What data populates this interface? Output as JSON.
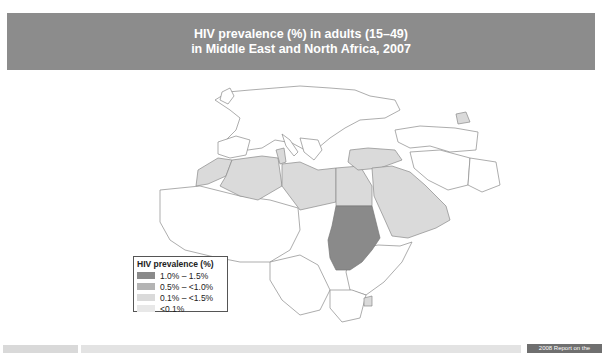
{
  "header": {
    "title_line1": "HIV prevalence (%) in adults (15–49)",
    "title_line2": "in Middle East and North Africa, 2007"
  },
  "legend": {
    "title": "HIV prevalence (%)",
    "items": [
      {
        "label": "1.0% – 1.5%",
        "color": "#8a8a8a"
      },
      {
        "label": "0.5% – <1.0%",
        "color": "#b4b4b4"
      },
      {
        "label": "0.1% – <1.5%",
        "color": "#dadada"
      },
      {
        "label": "<0.1%",
        "color": "#e8e8e8"
      }
    ]
  },
  "map": {
    "region": "Middle East and North Africa",
    "highlighted": [
      {
        "country": "Sudan",
        "category": "1.0% – 1.5%"
      },
      {
        "country": "Morocco",
        "category": "0.1% – <1.5%"
      },
      {
        "country": "Algeria",
        "category": "0.1% – <1.5%"
      },
      {
        "country": "Tunisia",
        "category": "0.1% – <1.5%"
      },
      {
        "country": "Libya",
        "category": "0.1% – <1.5%"
      },
      {
        "country": "Egypt",
        "category": "0.1% – <1.5%"
      },
      {
        "country": "Turkey",
        "category": "0.1% – <1.5%"
      },
      {
        "country": "Saudi Arabia",
        "category": "0.1% – <1.5%"
      },
      {
        "country": "Iraq",
        "category": "0.1% – <1.5%"
      },
      {
        "country": "Yemen",
        "category": "0.1% – <1.5%"
      },
      {
        "country": "Oman",
        "category": "0.1% – <1.5%"
      }
    ],
    "colors": {
      "land": "#ffffff",
      "border": "#8a8a8a",
      "high": "#8a8a8a",
      "low": "#dadada"
    }
  },
  "footer": {
    "right_label": "2008 Report on the"
  }
}
